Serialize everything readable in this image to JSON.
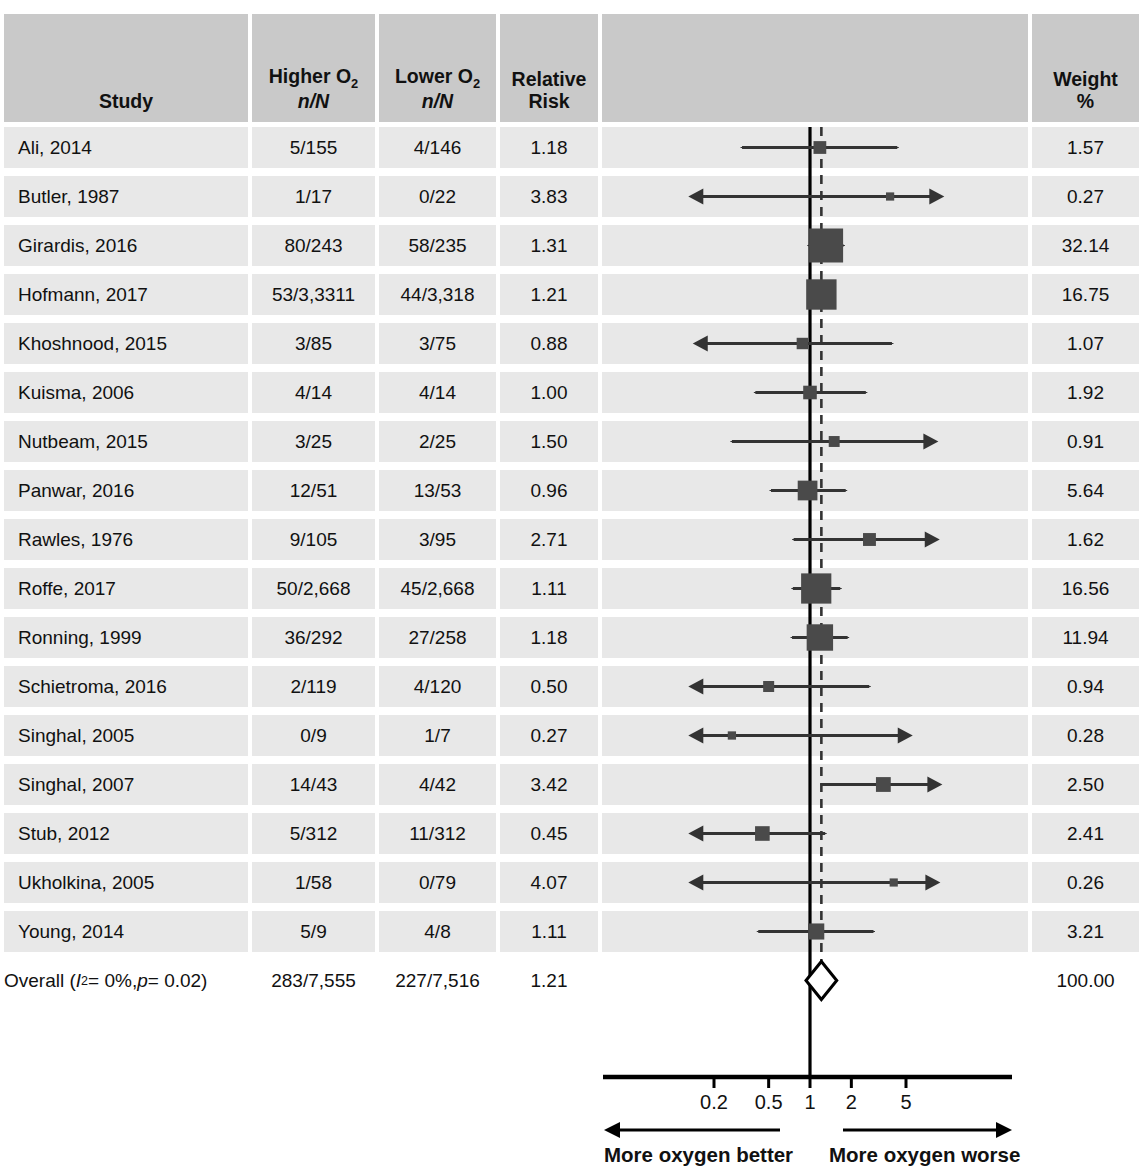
{
  "chart_data": {
    "type": "forest",
    "title": "",
    "xlabel": "Relative Risk",
    "xscale": "log",
    "xlim": [
      0.12,
      9.5
    ],
    "ticks": [
      {
        "value": 0.2,
        "label": "0.2"
      },
      {
        "value": 0.5,
        "label": "0.5"
      },
      {
        "value": 1,
        "label": "1"
      },
      {
        "value": 2,
        "label": "2"
      },
      {
        "value": 5,
        "label": "5"
      }
    ],
    "null_line": 1,
    "pooled_line": 1.21,
    "left_direction_label": "More oxygen better",
    "right_direction_label": "More oxygen worse",
    "columns": {
      "study": "Study",
      "higher_o2": "Higher O",
      "higher_o2_sub": "2",
      "higher_o2_unit": "n/N",
      "lower_o2": "Lower O",
      "lower_o2_sub": "2",
      "lower_o2_unit": "n/N",
      "relative_risk_line1": "Relative",
      "relative_risk_line2": "Risk",
      "weight_line1": "Weight",
      "weight_line2": "%"
    },
    "rows": [
      {
        "study": "Ali, 2014",
        "higher": "5/155",
        "lower": "4/146",
        "rr": "1.18",
        "rr_value": 1.18,
        "ci_low": 0.32,
        "ci_high": 4.32,
        "weight": "1.57",
        "weight_value": 1.57,
        "arrow_left": false,
        "arrow_right": false
      },
      {
        "study": "Butler, 1987",
        "higher": "1/17",
        "lower": "0/22",
        "rr": "3.83",
        "rr_value": 3.83,
        "ci_low": 0.13,
        "ci_high": 9.5,
        "weight": "0.27",
        "weight_value": 0.27,
        "arrow_left": true,
        "arrow_right": true
      },
      {
        "study": "Girardis, 2016",
        "higher": "80/243",
        "lower": "58/235",
        "rr": "1.31",
        "rr_value": 1.31,
        "ci_low": 0.98,
        "ci_high": 1.75,
        "weight": "32.14",
        "weight_value": 32.14,
        "arrow_left": false,
        "arrow_right": false
      },
      {
        "study": "Hofmann, 2017",
        "higher": "53/3,3311",
        "lower": "44/3,318",
        "rr": "1.21",
        "rr_value": 1.21,
        "ci_low": 1.02,
        "ci_high": 1.44,
        "weight": "16.75",
        "weight_value": 16.75,
        "arrow_left": false,
        "arrow_right": false
      },
      {
        "study": "Khoshnood, 2015",
        "higher": "3/85",
        "lower": "3/75",
        "rr": "0.88",
        "rr_value": 0.88,
        "ci_low": 0.14,
        "ci_high": 3.95,
        "weight": "1.07",
        "weight_value": 1.07,
        "arrow_left": true,
        "arrow_right": false
      },
      {
        "study": "Kuisma, 2006",
        "higher": "4/14",
        "lower": "4/14",
        "rr": "1.00",
        "rr_value": 1.0,
        "ci_low": 0.4,
        "ci_high": 2.55,
        "weight": "1.92",
        "weight_value": 1.92,
        "arrow_left": false,
        "arrow_right": false
      },
      {
        "study": "Nutbeam, 2015",
        "higher": "3/25",
        "lower": "2/25",
        "rr": "1.50",
        "rr_value": 1.5,
        "ci_low": 0.27,
        "ci_high": 8.6,
        "weight": "0.91",
        "weight_value": 0.91,
        "arrow_left": false,
        "arrow_right": true
      },
      {
        "study": "Panwar, 2016",
        "higher": "12/51",
        "lower": "13/53",
        "rr": "0.96",
        "rr_value": 0.96,
        "ci_low": 0.52,
        "ci_high": 1.82,
        "weight": "5.64",
        "weight_value": 5.64,
        "arrow_left": false,
        "arrow_right": false
      },
      {
        "study": "Rawles, 1976",
        "higher": "9/105",
        "lower": "3/95",
        "rr": "2.71",
        "rr_value": 2.71,
        "ci_low": 0.76,
        "ci_high": 8.8,
        "weight": "1.62",
        "weight_value": 1.62,
        "arrow_left": false,
        "arrow_right": true
      },
      {
        "study": "Roffe, 2017",
        "higher": "50/2,668",
        "lower": "45/2,668",
        "rr": "1.11",
        "rr_value": 1.11,
        "ci_low": 0.75,
        "ci_high": 1.66,
        "weight": "16.56",
        "weight_value": 16.56,
        "arrow_left": false,
        "arrow_right": false
      },
      {
        "study": "Ronning, 1999",
        "higher": "36/292",
        "lower": "27/258",
        "rr": "1.18",
        "rr_value": 1.18,
        "ci_low": 0.74,
        "ci_high": 1.88,
        "weight": "11.94",
        "weight_value": 11.94,
        "arrow_left": false,
        "arrow_right": false
      },
      {
        "study": "Schietroma, 2016",
        "higher": "2/119",
        "lower": "4/120",
        "rr": "0.50",
        "rr_value": 0.5,
        "ci_low": 0.13,
        "ci_high": 2.7,
        "weight": "0.94",
        "weight_value": 0.94,
        "arrow_left": true,
        "arrow_right": false
      },
      {
        "study": "Singhal, 2005",
        "higher": "0/9",
        "lower": "1/7",
        "rr": "0.27",
        "rr_value": 0.27,
        "ci_low": 0.13,
        "ci_high": 5.6,
        "weight": "0.28",
        "weight_value": 0.28,
        "arrow_left": true,
        "arrow_right": true
      },
      {
        "study": "Singhal, 2007",
        "higher": "14/43",
        "lower": "4/42",
        "rr": "3.42",
        "rr_value": 3.42,
        "ci_low": 1.22,
        "ci_high": 9.2,
        "weight": "2.50",
        "weight_value": 2.5,
        "arrow_left": false,
        "arrow_right": true
      },
      {
        "study": "Stub, 2012",
        "higher": "5/312",
        "lower": "11/312",
        "rr": "0.45",
        "rr_value": 0.45,
        "ci_low": 0.13,
        "ci_high": 1.29,
        "weight": "2.41",
        "weight_value": 2.41,
        "arrow_left": true,
        "arrow_right": false
      },
      {
        "study": "Ukholkina, 2005",
        "higher": "1/58",
        "lower": "0/79",
        "rr": "4.07",
        "rr_value": 4.07,
        "ci_low": 0.13,
        "ci_high": 8.9,
        "weight": "0.26",
        "weight_value": 0.26,
        "arrow_left": true,
        "arrow_right": true
      },
      {
        "study": "Young, 2014",
        "higher": "5/9",
        "lower": "4/8",
        "rr": "1.11",
        "rr_value": 1.11,
        "ci_low": 0.42,
        "ci_high": 2.9,
        "weight": "3.21",
        "weight_value": 3.21,
        "arrow_left": false,
        "arrow_right": false
      }
    ],
    "overall": {
      "label_prefix": "Overall (",
      "i_squared_symbol": "I",
      "i_squared_sup": "2",
      "i_squared_text": " = 0%, ",
      "p_symbol": "p",
      "p_text": " = 0.02)",
      "higher": "283/7,555",
      "lower": "227/7,516",
      "rr": "1.21",
      "rr_value": 1.21,
      "ci_low": 1.07,
      "ci_high": 1.37,
      "weight": "100.00"
    },
    "colors": {
      "header_band": "#c9c9c9",
      "row_band": "#e8e8e8",
      "marker": "#4a4a4a",
      "line": "#333333",
      "axis": "#000000",
      "text": "#111111"
    }
  }
}
